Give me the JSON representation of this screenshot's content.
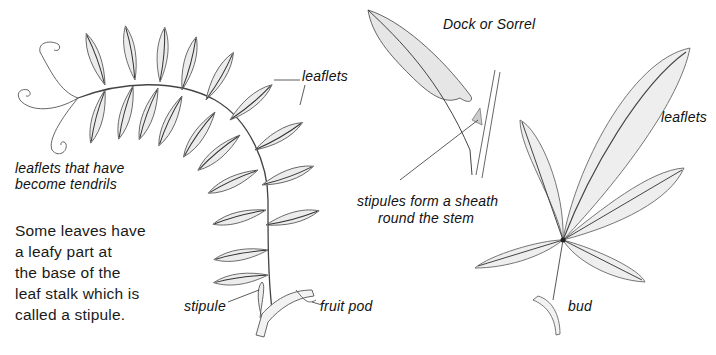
{
  "labels": {
    "vetch_leaflets": "leaflets",
    "tendrils": [
      "leaflets that have",
      "become tendrils"
    ],
    "stipule": "stipule",
    "fruit_pod": "fruit pod",
    "dock_title": "Dock or Sorrel",
    "sheath": [
      "stipules form a sheath",
      "round the stem"
    ],
    "palmate_leaflets": "leaflets",
    "bud": "bud"
  },
  "body_text": [
    "Some leaves have",
    "a leafy part at",
    "the base of the",
    "leaf stalk which is",
    "called a stipule."
  ],
  "colors": {
    "ink": "#3a3a3a",
    "leaf_fill": "#eeeeee",
    "leaf_fill_dark": "#e2e2e2",
    "text": "#111111"
  }
}
